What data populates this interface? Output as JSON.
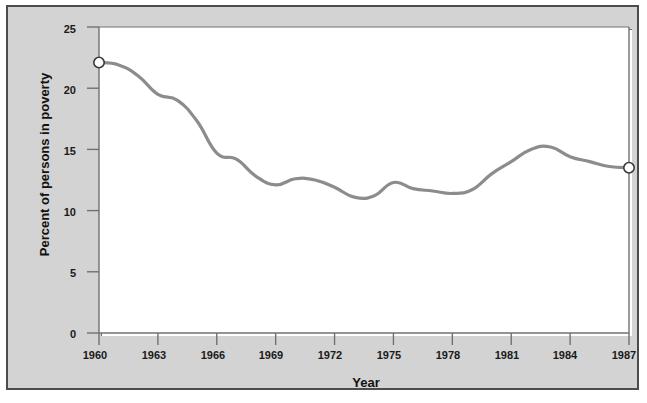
{
  "figure": {
    "title_lines": [
      "Figure 2.5",
      "Trend in Poverty,",
      "1960–1987"
    ],
    "legend_bar_color": "#676767",
    "legend_box_color": "#c9c9c9",
    "frame_color": "#4c4c4c",
    "page_background": "#d3d3d3",
    "plot_background": "#ffffff"
  },
  "chart_data": {
    "type": "line",
    "title": "Figure 2.5 Trend in Poverty, 1960–1987",
    "xlabel": "Year",
    "ylabel": "Percent of persons in poverty",
    "xlim": [
      1960,
      1987
    ],
    "ylim": [
      0,
      25
    ],
    "grid": false,
    "legend_position": "top-right",
    "line_color": "#8c8c8c",
    "marker_style": "open-circle",
    "markers_at": [
      1960,
      1987
    ],
    "xticks": [
      1960,
      1963,
      1966,
      1969,
      1972,
      1975,
      1978,
      1981,
      1984,
      1987
    ],
    "xtick_labels": [
      "1960",
      "1963",
      "1966",
      "1969",
      "1972",
      "1975",
      "1978",
      "1981",
      "1984",
      "1987"
    ],
    "yticks": [
      0,
      5,
      10,
      15,
      20,
      25
    ],
    "ytick_labels": [
      "0",
      "5",
      "10",
      "15",
      "20",
      "25"
    ],
    "x": [
      1960,
      1961,
      1962,
      1963,
      1964,
      1965,
      1966,
      1967,
      1968,
      1969,
      1970,
      1971,
      1972,
      1973,
      1974,
      1975,
      1976,
      1977,
      1978,
      1979,
      1980,
      1981,
      1982,
      1983,
      1984,
      1985,
      1986,
      1987
    ],
    "series": [
      {
        "name": "Percent of persons in poverty",
        "values": [
          22.1,
          21.9,
          21.0,
          19.5,
          19.0,
          17.3,
          14.7,
          14.2,
          12.8,
          12.1,
          12.6,
          12.5,
          11.9,
          11.1,
          11.2,
          12.3,
          11.8,
          11.6,
          11.4,
          11.7,
          13.0,
          14.0,
          15.0,
          15.2,
          14.4,
          14.0,
          13.6,
          13.5
        ]
      }
    ]
  },
  "axes": {
    "x_title": "Year",
    "y_title": "Percent of persons in poverty"
  }
}
